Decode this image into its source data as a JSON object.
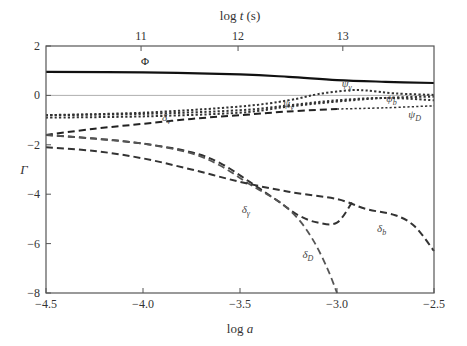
{
  "chart_data": {
    "type": "line",
    "title": "",
    "xlabel": "log a",
    "ylabel": "Γ",
    "x2label": "log t (s)",
    "xlim": [
      -4.5,
      -2.5
    ],
    "ylim": [
      -8,
      2
    ],
    "xticks": [
      -4.5,
      -4.0,
      -3.5,
      -3.0,
      -2.5
    ],
    "xtick_labels": [
      "−4.5",
      "−4.0",
      "−3.5",
      "−3.0",
      "−2.5"
    ],
    "yticks": [
      2,
      0,
      -2,
      -4,
      -6,
      -8
    ],
    "ytick_labels": [
      "2",
      "0",
      "−2",
      "−4",
      "−6",
      "−8"
    ],
    "x2ticks": [
      {
        "label": "11",
        "loga": -4.01
      },
      {
        "label": "12",
        "loga": -3.51
      },
      {
        "label": "13",
        "loga": -2.97
      }
    ],
    "grid": false,
    "legend": "inline labels",
    "series": [
      {
        "name": "Φ",
        "style": "solid",
        "width": 2.2,
        "color": "#111111",
        "x": [
          -4.5,
          -4.0,
          -3.5,
          -3.25,
          -3.0,
          -2.75,
          -2.5
        ],
        "y": [
          0.95,
          0.93,
          0.85,
          0.75,
          0.62,
          0.55,
          0.5
        ]
      },
      {
        "name": "zero",
        "style": "solid",
        "width": 0.8,
        "color": "#999999",
        "x": [
          -4.5,
          -2.5
        ],
        "y": [
          0,
          0
        ]
      },
      {
        "name": "ψ_γ",
        "style": "dotted",
        "width": 2,
        "color": "#333333",
        "x": [
          -4.5,
          -4.0,
          -3.5,
          -3.25,
          -3.1,
          -2.95,
          -2.85,
          -2.7,
          -2.5
        ],
        "y": [
          -0.8,
          -0.7,
          -0.45,
          -0.2,
          0.05,
          0.2,
          0.2,
          0.08,
          0.02
        ]
      },
      {
        "name": "ψ_b",
        "style": "dotted",
        "width": 2,
        "color": "#333333",
        "x": [
          -4.5,
          -4.0,
          -3.5,
          -3.25,
          -3.0,
          -2.75,
          -2.5
        ],
        "y": [
          -0.8,
          -0.75,
          -0.6,
          -0.4,
          -0.2,
          -0.1,
          -0.2
        ]
      },
      {
        "name": "ψ_ν",
        "style": "dotted",
        "width": 2,
        "color": "#333333",
        "x": [
          -4.5,
          -4.0,
          -3.5,
          -3.25,
          -3.0,
          -2.75,
          -2.5
        ],
        "y": [
          -0.9,
          -0.85,
          -0.7,
          -0.45,
          -0.25,
          -0.1,
          -0.05
        ]
      },
      {
        "name": "δ_ν / ψ_D",
        "style": "dashed",
        "width": 2,
        "color": "#222222",
        "x": [
          -4.5,
          -4.25,
          -4.0,
          -3.75,
          -3.5,
          -3.25,
          -3.0
        ],
        "y": [
          -1.6,
          -1.35,
          -1.15,
          -0.95,
          -0.8,
          -0.65,
          -0.55
        ]
      },
      {
        "name": "ψ_D",
        "style": "dotted",
        "width": 1.5,
        "color": "#333333",
        "x": [
          -3.0,
          -2.75,
          -2.5
        ],
        "y": [
          -0.55,
          -0.5,
          -0.42
        ]
      },
      {
        "name": "δ_γ",
        "style": "dashed",
        "width": 2,
        "color": "#333333",
        "x": [
          -4.5,
          -4.25,
          -4.0,
          -3.75,
          -3.6,
          -3.45,
          -3.3,
          -3.2,
          -3.1,
          -3.0,
          -2.92
        ],
        "y": [
          -1.6,
          -1.75,
          -1.95,
          -2.3,
          -2.75,
          -3.5,
          -4.3,
          -4.85,
          -5.15,
          -5.15,
          -4.3
        ]
      },
      {
        "name": "δ_D",
        "style": "dashed",
        "width": 1.8,
        "color": "#555555",
        "x": [
          -4.5,
          -4.25,
          -4.0,
          -3.75,
          -3.6,
          -3.45,
          -3.3,
          -3.2,
          -3.12,
          -3.05,
          -3.0
        ],
        "y": [
          -1.6,
          -1.75,
          -1.95,
          -2.35,
          -2.85,
          -3.6,
          -4.3,
          -5.0,
          -5.9,
          -7.0,
          -8.0
        ]
      },
      {
        "name": "δ_b",
        "style": "dashed",
        "width": 2,
        "color": "#333333",
        "x": [
          -4.5,
          -4.25,
          -4.0,
          -3.75,
          -3.5,
          -3.25,
          -3.0,
          -2.85,
          -2.7,
          -2.6,
          -2.5
        ],
        "y": [
          -2.1,
          -2.25,
          -2.55,
          -3.0,
          -3.5,
          -3.9,
          -4.2,
          -4.6,
          -4.85,
          -5.3,
          -6.3
        ]
      }
    ],
    "annotations": [
      {
        "text": "Φ",
        "x": -3.99,
        "y": 1.25,
        "italic": false
      },
      {
        "text": "ψ_γ",
        "x": -2.95,
        "y": 0.35,
        "italic": true
      },
      {
        "text": "ψ_ν",
        "x": -3.25,
        "y": -0.45,
        "italic": true
      },
      {
        "text": "ψ_b",
        "x": -2.72,
        "y": -0.25,
        "italic": true
      },
      {
        "text": "ψ_D",
        "x": -2.6,
        "y": -0.9,
        "italic": true
      },
      {
        "text": "δ_ν",
        "x": -3.88,
        "y": -1.05,
        "italic": true
      },
      {
        "text": "δ_γ",
        "x": -3.47,
        "y": -4.75,
        "italic": true
      },
      {
        "text": "δ_b",
        "x": -2.77,
        "y": -5.55,
        "italic": true
      },
      {
        "text": "δ_D",
        "x": -3.15,
        "y": -6.6,
        "italic": true
      }
    ]
  },
  "labels": {
    "xlabel_main": "log ",
    "xlabel_var": "a",
    "x2label_main": "log ",
    "x2label_var": "t",
    "x2label_unit": " (s)",
    "ylabel": "Γ"
  }
}
